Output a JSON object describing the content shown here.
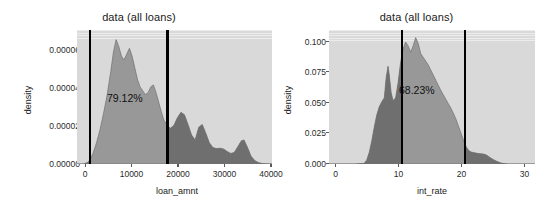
{
  "figure": {
    "background": "#ffffff",
    "panel_background": "#d9d9d9",
    "grid_color": "#ffffff",
    "density_fill": "#8a8a8a",
    "density_fill_dark": "#6e6e6e",
    "vline_color": "#000000",
    "width": 555,
    "height": 208
  },
  "chart_data": [
    {
      "type": "area",
      "id": "loan-amount-density",
      "title": "data (all loans)",
      "xlabel": "loan_amnt",
      "ylabel": "density",
      "xlim": [
        -2400,
        41500
      ],
      "ylim": [
        0,
        6.95e-05
      ],
      "xticks": [
        0,
        10000,
        20000,
        30000,
        40000
      ],
      "xticklabels": [
        "0",
        "10000",
        "20000",
        "30000",
        "40000"
      ],
      "yticks": [
        0.0,
        2e-05,
        4e-05,
        6e-05
      ],
      "yticklabels": [
        "0.00000",
        "0.00002",
        "0.00004",
        "0.00006"
      ],
      "grid": true,
      "annotation": "79.12%",
      "annotation_x": 9000,
      "annotation_y": 3.05e-05,
      "vlines": [
        500,
        18000
      ],
      "x": [
        -2400,
        -1000,
        0,
        500,
        1200,
        2000,
        2800,
        3600,
        4400,
        5200,
        5800,
        6400,
        7000,
        7600,
        8200,
        8800,
        9400,
        10000,
        10600,
        11200,
        11800,
        12400,
        13000,
        13600,
        14200,
        14800,
        15400,
        16000,
        16600,
        17200,
        18000,
        18600,
        19400,
        20200,
        21000,
        21800,
        22600,
        23400,
        24200,
        25000,
        25800,
        26600,
        27400,
        28200,
        29000,
        29800,
        30600,
        31400,
        32200,
        33000,
        33800,
        34600,
        35200,
        36000,
        36800,
        37600,
        38400,
        39200,
        40000,
        41500
      ],
      "y": [
        0.0,
        0.0,
        8e-07,
        2.1e-06,
        5.5e-06,
        1.1e-05,
        1.8e-05,
        2.65e-05,
        3.6e-05,
        4.8e-05,
        5.8e-05,
        6.45e-05,
        6.1e-05,
        5.6e-05,
        5.4e-05,
        5.7e-05,
        6e-05,
        5.6e-05,
        5e-05,
        4.4e-05,
        4e-05,
        3.8e-05,
        3.6e-05,
        3.7e-05,
        4e-05,
        4.1e-05,
        3.7e-05,
        3.2e-05,
        2.7e-05,
        2.25e-05,
        2e-05,
        1.85e-05,
        2e-05,
        2.4e-05,
        2.68e-05,
        2.55e-05,
        2.05e-05,
        1.5e-05,
        1.25e-05,
        1.9e-05,
        2.05e-05,
        1.6e-05,
        1.1e-05,
        8.5e-06,
        8e-06,
        8.2e-06,
        7.8e-06,
        6.5e-06,
        5.5e-06,
        6e-06,
        9e-06,
        1.2e-05,
        1.25e-05,
        8.5e-06,
        4e-06,
        1.8e-06,
        8e-07,
        3e-07,
        1e-07,
        0.0
      ]
    },
    {
      "type": "area",
      "id": "int-rate-density",
      "title": "data (all loans)",
      "xlabel": "int_rate",
      "ylabel": "density",
      "xlim": [
        -1.6,
        31.2
      ],
      "ylim": [
        0,
        0.1055
      ],
      "xticks": [
        0,
        10,
        20,
        30
      ],
      "xticklabels": [
        "0",
        "10",
        "20",
        "30"
      ],
      "yticks": [
        0.0,
        0.025,
        0.05,
        0.075,
        0.1
      ],
      "yticklabels": [
        "0.000",
        "0.025",
        "0.050",
        "0.075",
        "0.100"
      ],
      "grid": true,
      "annotation": "68.23%",
      "annotation_x": 14.2,
      "annotation_y": 0.0505,
      "vlines": [
        10,
        20
      ],
      "x": [
        -1.6,
        2.5,
        4.0,
        4.4,
        4.8,
        5.2,
        5.6,
        6.0,
        6.4,
        6.8,
        7.2,
        7.5,
        7.8,
        8.0,
        8.3,
        8.6,
        9.0,
        9.4,
        9.8,
        10.2,
        10.6,
        11.0,
        11.4,
        11.8,
        12.2,
        12.6,
        13.0,
        13.4,
        13.8,
        14.2,
        14.6,
        15.0,
        15.4,
        15.8,
        16.2,
        16.6,
        17.0,
        17.4,
        17.8,
        18.2,
        18.6,
        19.0,
        19.4,
        19.8,
        20.2,
        20.6,
        21.0,
        21.4,
        21.8,
        22.2,
        22.6,
        23.0,
        23.4,
        23.8,
        24.2,
        24.6,
        25.0,
        25.4,
        25.8,
        26.2,
        26.6,
        27.0,
        28.0,
        31.2
      ],
      "y": [
        0.0,
        0.0,
        0.0005,
        0.003,
        0.009,
        0.018,
        0.029,
        0.0385,
        0.045,
        0.049,
        0.052,
        0.068,
        0.077,
        0.07,
        0.056,
        0.05,
        0.052,
        0.064,
        0.08,
        0.0905,
        0.096,
        0.093,
        0.088,
        0.093,
        0.0995,
        0.095,
        0.087,
        0.084,
        0.081,
        0.078,
        0.074,
        0.07,
        0.066,
        0.062,
        0.058,
        0.0545,
        0.051,
        0.0475,
        0.044,
        0.04,
        0.0355,
        0.03,
        0.0245,
        0.019,
        0.014,
        0.0108,
        0.0095,
        0.009,
        0.0086,
        0.0082,
        0.008,
        0.0078,
        0.0072,
        0.006,
        0.0046,
        0.0034,
        0.0024,
        0.0015,
        0.0008,
        0.0004,
        0.0001,
        0.0,
        0.0,
        0.0
      ]
    }
  ]
}
